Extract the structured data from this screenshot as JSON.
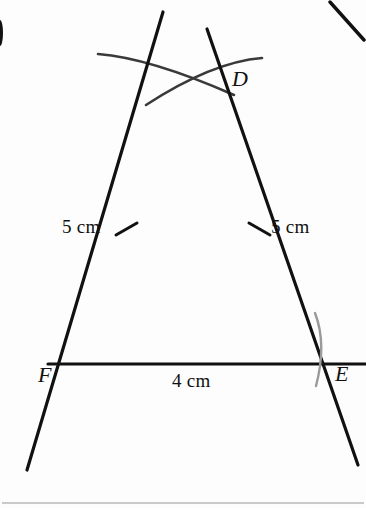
{
  "figure": {
    "title_semantic": "geometry-construction-triangle-DEF",
    "background_color": "#fdfdfd",
    "line_color": "#111111",
    "arc_color": "#3a3a3a",
    "faint_arc_color": "#9a9a9a",
    "rule_color": "#b9b9b9",
    "labels": {
      "apex": "D",
      "base_right": "E",
      "base_left": "F",
      "left_side_length": "5 cm",
      "right_side_length": "5 cm",
      "base_length": "4 cm"
    },
    "geometry": {
      "apex_point": [
        193,
        81
      ],
      "base_left_point": [
        66,
        364
      ],
      "base_right_point": [
        321,
        364
      ],
      "base_line": [
        [
          48,
          364
        ],
        [
          366,
          364
        ]
      ],
      "left_side_extended": [
        [
          163,
          12
        ],
        [
          27,
          470
        ]
      ],
      "right_side_extended": [
        [
          207,
          29
        ],
        [
          358,
          465
        ]
      ],
      "left_tick_at": [
        126,
        229
      ],
      "right_tick_at": [
        259,
        229
      ],
      "corner_fragment": [
        [
          330,
          2
        ],
        [
          364,
          40
        ]
      ],
      "bottom_rule_y": 503
    }
  }
}
